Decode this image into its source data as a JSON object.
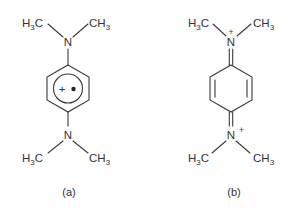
{
  "figure": {
    "structures": [
      {
        "id": "a",
        "caption": "(a)",
        "description": "Wurster's blue radical cation (delocalized aromatic ring with radical cation)",
        "top_amine": {
          "atom": "N",
          "left_group": "H3C",
          "right_group": "CH3"
        },
        "ring": {
          "type": "aromatic-hexagon",
          "inner_circle": true,
          "inner_label": "+•"
        },
        "bottom_amine": {
          "atom": "N",
          "left_group": "H3C",
          "right_group": "CH3"
        }
      },
      {
        "id": "b",
        "caption": "(b)",
        "description": "Quinoidal diiminium resonance form",
        "top_amine": {
          "atom": "N",
          "charge": "+",
          "left_group": "H3C",
          "right_group": "CH3",
          "ring_bond": "double"
        },
        "ring": {
          "type": "quinoid-hexagon",
          "inner_double_bonds": [
            "left",
            "right"
          ]
        },
        "bottom_amine": {
          "atom": "N",
          "charge": "+",
          "left_group": "H3C",
          "right_group": "CH3",
          "ring_bond": "double"
        }
      }
    ],
    "text": {
      "a_top_left": "H",
      "a_top_left_sub": "3",
      "a_top_left_c": "C",
      "a_top_right": "CH",
      "a_top_right_sub": "3",
      "a_top_n": "N",
      "a_ring_label": "+•",
      "a_bot_n": "N",
      "a_bot_left": "H",
      "a_bot_left_sub": "3",
      "a_bot_left_c": "C",
      "a_bot_right": "CH",
      "a_bot_right_sub": "3",
      "b_top_left": "H",
      "b_top_left_sub": "3",
      "b_top_left_c": "C",
      "b_top_right": "CH",
      "b_top_right_sub": "3",
      "b_top_n": "N",
      "b_top_charge": "+",
      "b_bot_n": "N",
      "b_bot_charge": "+",
      "b_bot_left": "H",
      "b_bot_left_sub": "3",
      "b_bot_left_c": "C",
      "b_bot_right": "CH",
      "b_bot_right_sub": "3",
      "caption_a": "(a)",
      "caption_b": "(b)"
    }
  }
}
